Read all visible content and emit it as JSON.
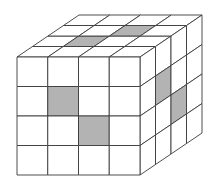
{
  "figure": {
    "grid_size": 4,
    "colors": {
      "background": "#ffffff",
      "face": "#ffffff",
      "shaded": "#b3b3b3",
      "line": "#3a3a3a"
    },
    "geometry": {
      "front_top_left": [
        17,
        57
      ],
      "front_bottom_right": [
        140,
        175
      ],
      "depth_vector": [
        62,
        -42
      ]
    },
    "shaded_cells": {
      "front": [
        [
          1,
          1
        ],
        [
          2,
          2
        ]
      ],
      "top": [
        [
          1,
          1
        ],
        [
          2,
          2
        ]
      ],
      "right": [
        [
          1,
          1
        ],
        [
          2,
          2
        ]
      ]
    },
    "shaded_cells_note": "front: [row from top, col from left]; top: [row from front edge, col from left]; right: [row from top, col from front edge]"
  }
}
